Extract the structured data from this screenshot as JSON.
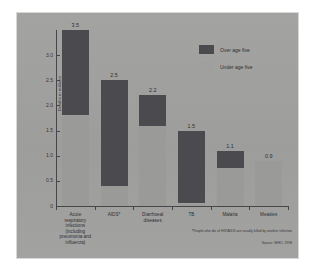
{
  "chart_data": {
    "type": "bar",
    "title": "",
    "subtitle": "",
    "xlabel": "",
    "ylabel": "Deaths in millions",
    "ylim": [
      0,
      3.5
    ],
    "yticks": [
      "0",
      "0.5",
      "1.0",
      "1.5",
      "2.0",
      "2.5",
      "3.0"
    ],
    "ytick_values": [
      0,
      0.5,
      1.0,
      1.5,
      2.0,
      2.5,
      3.0
    ],
    "grid": false,
    "legend_position": "top-right",
    "stacked": true,
    "categories": [
      "Acute respiratory infections (including pneumonia and influenza)",
      "AIDS*",
      "Diarrhoeal diseases",
      "TB",
      "Malaria",
      "Measles"
    ],
    "category_lines": [
      [
        "Acute",
        "respiratory",
        "infections",
        "(including",
        "pneumonia and",
        "influenza)"
      ],
      [
        "AIDS*"
      ],
      [
        "Diarrhoeal",
        "diseases"
      ],
      [
        "TB"
      ],
      [
        "Malaria"
      ],
      [
        "Measles"
      ]
    ],
    "series": [
      {
        "name": "Over age five",
        "color": "#4b4b4f",
        "values": [
          1.7,
          2.1,
          0.6,
          1.45,
          0.35,
          0.0
        ]
      },
      {
        "name": "Under age five",
        "color": "#9a9a98",
        "values": [
          1.8,
          0.4,
          1.6,
          0.05,
          0.75,
          0.9
        ]
      }
    ],
    "totals": [
      3.5,
      2.5,
      2.2,
      1.5,
      1.1,
      0.9
    ],
    "total_labels": [
      "3.5",
      "2.5",
      "2.2",
      "1.5",
      "1.1",
      "0.9"
    ],
    "annotations": {
      "footnote": "*People who die of HIV/AIDS are usually killed by another infection",
      "source": "Source: WHO, 1998"
    }
  },
  "legend": {
    "items": [
      {
        "label": "Over age five"
      },
      {
        "label": "Under age five"
      }
    ]
  }
}
